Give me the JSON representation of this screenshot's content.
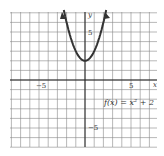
{
  "chart_data": {
    "type": "line",
    "title": "",
    "function_label": "f(x) = x² + 2",
    "xlabel": "x",
    "ylabel": "y",
    "xlim": [
      -8,
      8
    ],
    "ylim": [
      -7,
      7
    ],
    "grid": true,
    "tick_labels": {
      "x": [
        "-5",
        "5"
      ],
      "y": [
        "5",
        "-5"
      ]
    },
    "series": [
      {
        "name": "f(x) = x^2 + 2",
        "x": [
          -2.2,
          -2,
          -1.5,
          -1,
          -0.5,
          0,
          0.5,
          1,
          1.5,
          2,
          2.2
        ],
        "y": [
          6.84,
          6,
          4.25,
          3,
          2.25,
          2,
          2.25,
          3,
          4.25,
          6,
          6.84
        ]
      }
    ]
  },
  "labels": {
    "x_axis": "x",
    "y_axis": "y",
    "x_neg5": "−5",
    "x_pos5": "5",
    "y_pos5": "5",
    "y_neg5": "−5",
    "func": "f(x) = x² + 2"
  }
}
